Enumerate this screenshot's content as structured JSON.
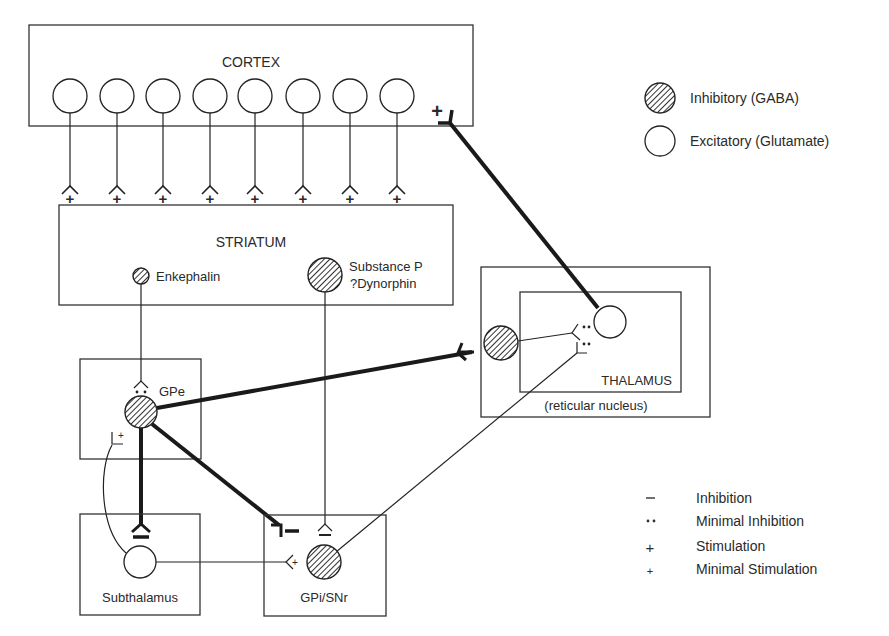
{
  "regions": {
    "cortex": "CORTEX",
    "striatum": "STRIATUM",
    "gpe": "GPe",
    "thalamus": "THALAMUS",
    "reticular": "(reticular nucleus)",
    "subthalamus": "Subthalamus",
    "gpi": "GPi/SNr"
  },
  "neuron_labels": {
    "enkephalin": "Enkephalin",
    "substance_p": "Substance P",
    "dynorphin": "?Dynorphin"
  },
  "cell_legend": [
    {
      "type": "inhibitory",
      "label": "Inhibitory (GABA)"
    },
    {
      "type": "excitatory",
      "label": "Excitatory (Glutamate)"
    }
  ],
  "synapse_legend": [
    {
      "symbol": "–",
      "label": "Inhibition"
    },
    {
      "symbol": "••",
      "label": "Minimal Inhibition"
    },
    {
      "symbol": "+",
      "label": "Stimulation"
    },
    {
      "symbol": "+",
      "label": "Minimal Stimulation"
    }
  ],
  "synapse_marks": {
    "plus": "+",
    "minus": "–"
  },
  "colors": {
    "line": "#222222",
    "hatch": "#333333",
    "background": "#ffffff"
  }
}
